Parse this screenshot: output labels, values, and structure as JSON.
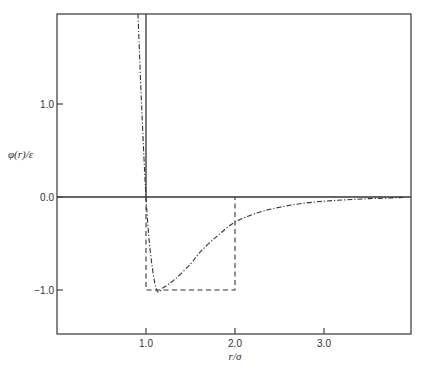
{
  "chart_data": {
    "type": "line",
    "title": "",
    "xlabel": "r/σ",
    "ylabel": "φ(r)/ε",
    "xlim": [
      0.0,
      3.98
    ],
    "ylim": [
      -1.47,
      1.97
    ],
    "x_ticks": [
      1.0,
      2.0,
      3.0
    ],
    "x_tick_labels": [
      "1.0",
      "2.0",
      "3.0"
    ],
    "y_ticks": [
      1.0,
      0.0,
      -1.0
    ],
    "y_tick_labels": [
      "1.0",
      "0.0",
      "−1.0"
    ],
    "grid": false,
    "legend": null,
    "series": [
      {
        "name": "hard-sphere wall",
        "style": "solid",
        "x": [
          1.0,
          1.0
        ],
        "y": [
          1.97,
          0.0
        ]
      },
      {
        "name": "zero line",
        "style": "solid",
        "x": [
          0.0,
          3.98
        ],
        "y": [
          0.0,
          0.0
        ]
      },
      {
        "name": "square-well potential",
        "style": "dashed",
        "x": [
          1.0,
          1.0,
          2.0,
          2.0
        ],
        "y": [
          0.0,
          -1.0,
          -1.0,
          0.0
        ]
      },
      {
        "name": "continuous potential",
        "style": "dash-dot",
        "x": [
          0.91,
          0.95,
          1.0,
          1.05,
          1.12,
          1.2,
          1.33,
          1.5,
          1.61,
          1.8,
          2.0,
          2.25,
          2.5,
          2.75,
          3.0,
          3.25,
          3.5,
          3.75,
          3.9
        ],
        "y": [
          1.97,
          1.0,
          0.0,
          -0.6,
          -1.0,
          -0.97,
          -0.88,
          -0.72,
          -0.59,
          -0.42,
          -0.27,
          -0.17,
          -0.11,
          -0.07,
          -0.045,
          -0.03,
          -0.018,
          -0.01,
          -0.005
        ]
      }
    ]
  }
}
